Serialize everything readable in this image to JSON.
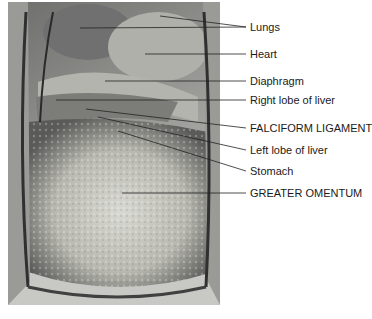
{
  "figure": {
    "image_description": "Anterior view of opened thorax and abdomen (cadaver dissection photograph)",
    "labels": [
      {
        "text": "Lungs",
        "y": 21
      },
      {
        "text": "Heart",
        "y": 48
      },
      {
        "text": "Diaphragm",
        "y": 76
      },
      {
        "text": "Right lobe of liver",
        "y": 95
      },
      {
        "text": "FALCIFORM LIGAMENT",
        "y": 122
      },
      {
        "text": "Left lobe of liver",
        "y": 144
      },
      {
        "text": "Stomach",
        "y": 165
      },
      {
        "text": "GREATER OMENTUM",
        "y": 187
      }
    ]
  }
}
